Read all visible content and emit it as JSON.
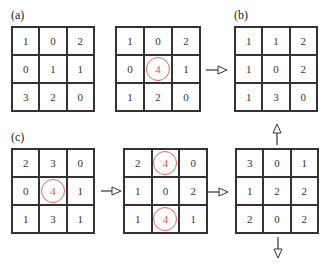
{
  "labels": {
    "a": "(a)",
    "b": "(b)",
    "c": "(c)"
  },
  "colors": {
    "highlight": "#d9534f",
    "circle": "#e06666",
    "line": "#333333"
  },
  "grids": {
    "a_input": {
      "cells": [
        "1",
        "0",
        "2",
        "0",
        "1",
        "1",
        "3",
        "2",
        "0"
      ],
      "highlight": []
    },
    "a_sum": {
      "cells": [
        "1",
        "0",
        "2",
        "0",
        "4",
        "1",
        "1",
        "2",
        "0"
      ],
      "highlight": [
        4
      ]
    },
    "b_result": {
      "cells": [
        "1",
        "1",
        "2",
        "1",
        "0",
        "2",
        "1",
        "3",
        "0"
      ],
      "highlight": []
    },
    "c_input": {
      "cells": [
        "2",
        "3",
        "0",
        "0",
        "4",
        "1",
        "1",
        "3",
        "1"
      ],
      "highlight": [
        4
      ]
    },
    "c_middle": {
      "cells": [
        "2",
        "4",
        "0",
        "1",
        "0",
        "2",
        "1",
        "4",
        "1"
      ],
      "highlight": [
        1,
        7
      ]
    },
    "c_result": {
      "cells": [
        "3",
        "0",
        "1",
        "1",
        "2",
        "2",
        "2",
        "0",
        "2"
      ],
      "highlight": []
    }
  }
}
